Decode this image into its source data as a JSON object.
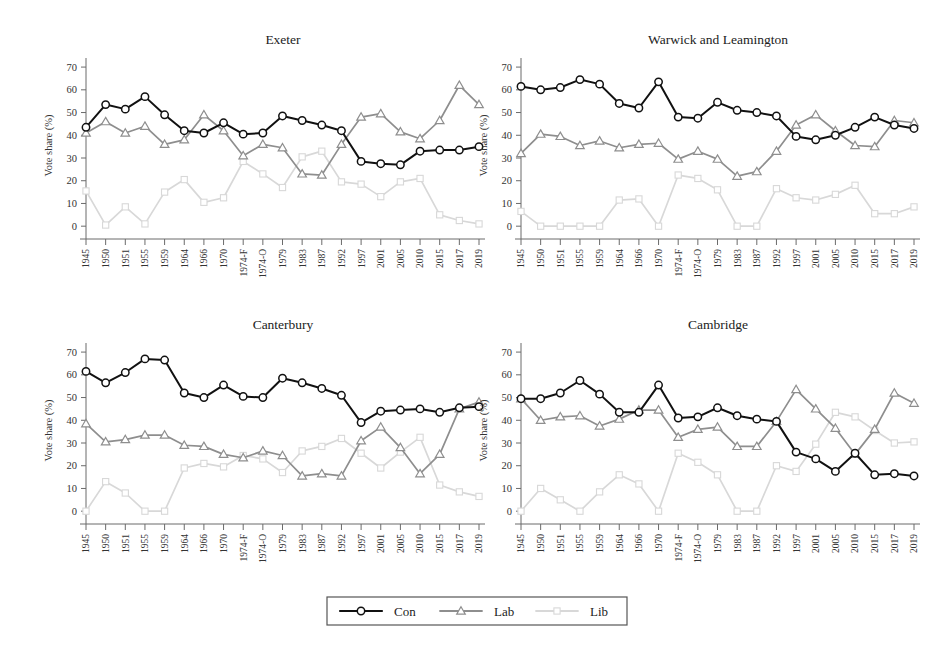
{
  "figure": {
    "ylabel": "Vote share (%)",
    "yticks": [
      0,
      10,
      20,
      30,
      40,
      50,
      60,
      70
    ],
    "ylim": [
      -3,
      74
    ],
    "grid": false,
    "legend_position": "bottom-center",
    "colors": {
      "Con": "#111111",
      "Lab": "#8e8e8e",
      "Lib": "#d8d8d8"
    },
    "markers": {
      "Con": "circle",
      "Lab": "triangle",
      "Lib": "square"
    }
  },
  "legend": {
    "entries": [
      {
        "label": "Con",
        "color": "#111111",
        "marker": "circle"
      },
      {
        "label": "Lab",
        "color": "#8e8e8e",
        "marker": "triangle"
      },
      {
        "label": "Lib",
        "color": "#d8d8d8",
        "marker": "square"
      }
    ]
  },
  "chart_data": [
    {
      "type": "line",
      "title": "Exeter",
      "xlabel": "",
      "ylabel": "Vote share (%)",
      "ylim": [
        0,
        70
      ],
      "grid": false,
      "legend": [
        "Con",
        "Lab",
        "Lib"
      ],
      "categories": [
        "1945",
        "1950",
        "1951",
        "1955",
        "1959",
        "1964",
        "1966",
        "1970",
        "1974-F",
        "1974-O",
        "1979",
        "1983",
        "1987",
        "1992",
        "1997",
        "2001",
        "2005",
        "2010",
        "2015",
        "2017",
        "2019"
      ],
      "series": [
        {
          "name": "Con",
          "values": [
            43.5,
            53.5,
            51.5,
            57.0,
            49.0,
            42.0,
            41.0,
            45.5,
            40.5,
            41.0,
            48.5,
            46.5,
            44.5,
            42.0,
            28.5,
            27.5,
            27.0,
            33.0,
            33.5,
            33.5,
            35.0
          ]
        },
        {
          "name": "Lab",
          "values": [
            41.0,
            46.0,
            41.0,
            44.0,
            36.0,
            38.0,
            49.0,
            42.0,
            31.0,
            36.0,
            34.5,
            23.0,
            22.5,
            36.0,
            48.0,
            49.5,
            41.5,
            38.5,
            46.5,
            62.0,
            53.5
          ]
        },
        {
          "name": "Lib",
          "values": [
            15.5,
            0.5,
            8.5,
            1.0,
            15.0,
            20.5,
            10.5,
            12.5,
            28.5,
            23.0,
            17.0,
            30.5,
            33.0,
            19.5,
            18.5,
            13.0,
            19.5,
            21.0,
            5.0,
            2.5,
            1.0
          ]
        }
      ]
    },
    {
      "type": "line",
      "title": "Warwick and Leamington",
      "xlabel": "",
      "ylabel": "Vote share (%)",
      "ylim": [
        0,
        70
      ],
      "grid": false,
      "legend": [
        "Con",
        "Lab",
        "Lib"
      ],
      "categories": [
        "1945",
        "1950",
        "1951",
        "1955",
        "1959",
        "1964",
        "1966",
        "1970",
        "1974-F",
        "1974-O",
        "1979",
        "1983",
        "1987",
        "1992",
        "1997",
        "2001",
        "2005",
        "2010",
        "2015",
        "2017",
        "2019"
      ],
      "series": [
        {
          "name": "Con",
          "values": [
            61.5,
            60.0,
            61.0,
            64.5,
            62.5,
            54.0,
            52.0,
            63.5,
            48.0,
            47.5,
            54.5,
            51.0,
            50.0,
            48.5,
            39.5,
            38.0,
            40.0,
            43.5,
            48.0,
            44.5,
            43.0
          ]
        },
        {
          "name": "Lab",
          "values": [
            32.0,
            40.5,
            39.5,
            35.5,
            37.5,
            34.5,
            36.0,
            36.5,
            29.5,
            33.0,
            29.5,
            22.0,
            24.0,
            33.0,
            44.5,
            49.0,
            42.0,
            35.5,
            35.0,
            46.5,
            45.5
          ]
        },
        {
          "name": "Lib",
          "values": [
            6.5,
            0.0,
            0.0,
            0.0,
            0.0,
            11.5,
            12.0,
            0.0,
            22.5,
            21.0,
            16.0,
            0.0,
            0.0,
            16.5,
            12.5,
            11.5,
            14.0,
            18.0,
            5.5,
            5.5,
            8.5
          ]
        }
      ]
    },
    {
      "type": "line",
      "title": "Canterbury",
      "xlabel": "",
      "ylabel": "Vote share (%)",
      "ylim": [
        0,
        70
      ],
      "grid": false,
      "legend": [
        "Con",
        "Lab",
        "Lib"
      ],
      "categories": [
        "1945",
        "1950",
        "1951",
        "1955",
        "1959",
        "1964",
        "1966",
        "1970",
        "1974-F",
        "1974-O",
        "1979",
        "1983",
        "1987",
        "1992",
        "1997",
        "2001",
        "2005",
        "2010",
        "2015",
        "2017",
        "2019"
      ],
      "series": [
        {
          "name": "Con",
          "values": [
            61.5,
            56.5,
            61.0,
            67.0,
            66.5,
            52.0,
            50.0,
            55.5,
            50.5,
            50.0,
            58.5,
            56.5,
            54.0,
            51.0,
            39.0,
            44.0,
            44.5,
            45.0,
            43.5,
            45.5,
            46.0
          ]
        },
        {
          "name": "Lab",
          "values": [
            38.5,
            30.5,
            31.5,
            33.5,
            33.5,
            29.0,
            28.5,
            25.0,
            23.5,
            26.5,
            24.5,
            15.5,
            16.5,
            15.5,
            31.0,
            37.0,
            28.0,
            16.5,
            25.0,
            45.0,
            48.0
          ]
        },
        {
          "name": "Lib",
          "values": [
            0.0,
            13.0,
            8.0,
            0.0,
            0.0,
            19.0,
            21.0,
            19.5,
            24.5,
            23.0,
            17.0,
            26.5,
            28.5,
            32.0,
            25.5,
            19.0,
            26.0,
            32.5,
            11.5,
            8.5,
            6.5
          ]
        }
      ]
    },
    {
      "type": "line",
      "title": "Cambridge",
      "xlabel": "",
      "ylabel": "Vote share (%)",
      "ylim": [
        0,
        70
      ],
      "grid": false,
      "legend": [
        "Con",
        "Lab",
        "Lib"
      ],
      "categories": [
        "1945",
        "1950",
        "1951",
        "1955",
        "1959",
        "1964",
        "1966",
        "1970",
        "1974-F",
        "1974-O",
        "1979",
        "1983",
        "1987",
        "1992",
        "1997",
        "2001",
        "2005",
        "2010",
        "2015",
        "2017",
        "2019"
      ],
      "series": [
        {
          "name": "Con",
          "values": [
            49.5,
            49.5,
            52.0,
            57.5,
            51.5,
            43.5,
            43.5,
            55.5,
            41.0,
            41.5,
            45.5,
            42.0,
            40.5,
            39.5,
            26.0,
            23.0,
            17.5,
            25.5,
            16.0,
            16.5,
            15.5
          ]
        },
        {
          "name": "Lab",
          "values": [
            49.5,
            40.0,
            41.5,
            42.0,
            37.5,
            40.5,
            44.5,
            44.5,
            32.5,
            36.0,
            37.0,
            28.5,
            28.5,
            39.5,
            53.5,
            45.0,
            36.5,
            25.0,
            36.0,
            52.0,
            47.5
          ]
        },
        {
          "name": "Lib",
          "values": [
            0.0,
            10.0,
            5.0,
            0.0,
            8.5,
            16.0,
            12.0,
            0.0,
            25.5,
            21.5,
            16.0,
            0.0,
            0.0,
            20.0,
            17.5,
            29.5,
            43.5,
            41.5,
            35.5,
            30.0,
            30.5
          ]
        }
      ]
    }
  ]
}
